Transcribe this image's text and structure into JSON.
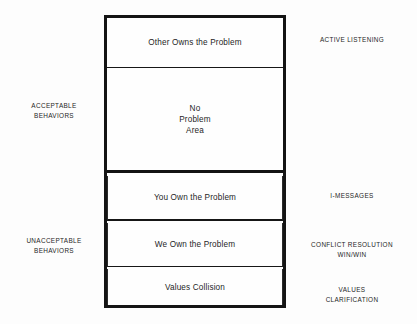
{
  "diagram": {
    "background_color": "#fdfdfd",
    "border_color": "#141414",
    "text_color": "#1f1f1f",
    "boxes": [
      {
        "id": "other-owns-the-problem",
        "label": "Other Owns the Problem"
      },
      {
        "id": "no-problem-area",
        "label": "No\nProblem\nArea"
      },
      {
        "id": "you-own-the-problem",
        "label": "You Own the Problem"
      },
      {
        "id": "we-own-the-problem",
        "label": "We Own the Problem"
      },
      {
        "id": "values-collision",
        "label": "Values Collision"
      }
    ],
    "left_labels": [
      {
        "id": "acceptable-behaviors",
        "label": "ACCEPTABLE\nBEHAVIORS"
      },
      {
        "id": "unacceptable-behaviors",
        "label": "UNACCEPTABLE\nBEHAVIORS"
      }
    ],
    "right_labels": [
      {
        "id": "active-listening",
        "label": "ACTIVE LISTENING"
      },
      {
        "id": "i-messages",
        "label": "I-MESSAGES"
      },
      {
        "id": "conflict-resolution",
        "label": "CONFLICT RESOLUTION\nWIN/WIN"
      },
      {
        "id": "values-clarification",
        "label": "VALUES\nCLARIFICATION"
      }
    ]
  }
}
